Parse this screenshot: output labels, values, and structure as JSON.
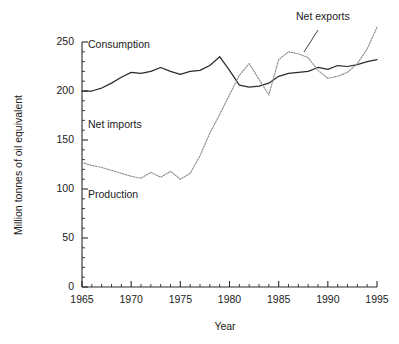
{
  "chart_data": {
    "type": "line",
    "title": "",
    "xlabel": "Year",
    "ylabel": "Million tonnes of oil equivalent",
    "xlim": [
      1965,
      1995
    ],
    "ylim": [
      0,
      250
    ],
    "xticks": [
      1965,
      1970,
      1975,
      1980,
      1985,
      1990,
      1995
    ],
    "yticks": [
      0,
      50,
      100,
      150,
      200,
      250
    ],
    "xtick_labels": [
      "1965",
      "1970",
      "1975",
      "1980",
      "1985",
      "1990",
      "1995"
    ],
    "ytick_labels": [
      "0",
      "50",
      "100",
      "150",
      "200",
      "250"
    ],
    "x_minor_step": 1,
    "y_minor_step": 10,
    "grid": false,
    "legend": "none",
    "x": [
      1965,
      1966,
      1967,
      1968,
      1969,
      1970,
      1971,
      1972,
      1973,
      1974,
      1975,
      1976,
      1977,
      1978,
      1979,
      1980,
      1981,
      1982,
      1983,
      1984,
      1985,
      1986,
      1987,
      1988,
      1989,
      1990,
      1991,
      1992,
      1993,
      1994,
      1995
    ],
    "series": [
      {
        "name": "Consumption",
        "style": "solid",
        "color": "#2b2b2b",
        "values": [
          200,
          200,
          203,
          208,
          214,
          219,
          218,
          220,
          224,
          220,
          217,
          220,
          221,
          226,
          235,
          221,
          206,
          204,
          205,
          208,
          215,
          218,
          219,
          220,
          224,
          222,
          226,
          225,
          227,
          230,
          232
        ]
      },
      {
        "name": "Production",
        "style": "dotted",
        "color": "#8d8d8d",
        "values": [
          127,
          124,
          122,
          119,
          116,
          113,
          111,
          117,
          112,
          118,
          110,
          116,
          134,
          157,
          176,
          196,
          216,
          228,
          212,
          196,
          232,
          240,
          238,
          234,
          221,
          213,
          215,
          219,
          228,
          243,
          265
        ]
      }
    ],
    "annotations": [
      {
        "name": "consumption-label",
        "text": "Consumption",
        "x_px": 88,
        "y_px": 48
      },
      {
        "name": "net-imports-label",
        "text": "Net imports",
        "x_px": 88,
        "y_px": 128
      },
      {
        "name": "production-label",
        "text": "Production",
        "x_px": 88,
        "y_px": 198
      },
      {
        "name": "net-exports-label",
        "text": "Net exports",
        "x_px": 296,
        "y_px": 20
      }
    ]
  }
}
